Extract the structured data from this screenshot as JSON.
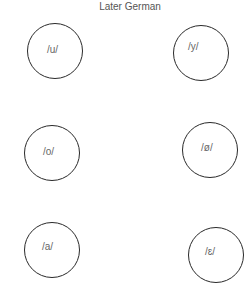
{
  "title": "Later German",
  "nodes": [
    {
      "id": "u",
      "label": "/u/",
      "cx": 55,
      "cy": 51
    },
    {
      "id": "y",
      "label": "/y/",
      "cx": 201,
      "cy": 53
    },
    {
      "id": "o",
      "label": "/o/",
      "cx": 52,
      "cy": 153
    },
    {
      "id": "oe",
      "label": "/ø/",
      "cx": 210,
      "cy": 150
    },
    {
      "id": "a",
      "label": "/a/",
      "cx": 52,
      "cy": 250
    },
    {
      "id": "e",
      "label": "/ɛ/",
      "cx": 216,
      "cy": 255
    }
  ],
  "colors": {
    "circle_stroke": "#2a2a2a",
    "label_text": "#666666",
    "title_text": "#555555"
  }
}
